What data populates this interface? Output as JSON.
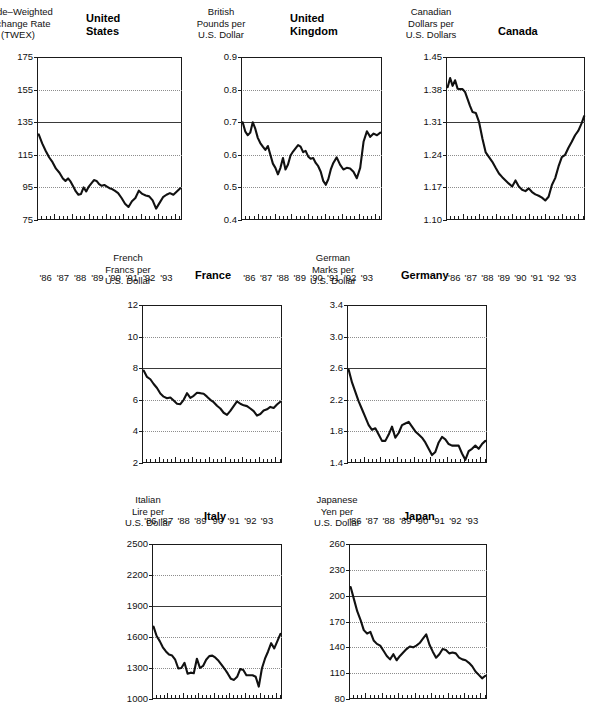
{
  "figure": {
    "panel_layout": "3 columns top row, 2 columns middle row, 2 columns bottom row",
    "line_color": "#111111",
    "grid_color": "#8d8d8d",
    "reference_line_color": "#3a3a3a"
  },
  "chart_data": [
    {
      "type": "line",
      "id": "united-states",
      "title": "United\nStates",
      "ylabel": "Trade–Weighted\nExchange Rate\n(TWEX)",
      "xlabel": "",
      "ylim": [
        75,
        175
      ],
      "yticks": [
        175,
        155,
        135,
        115,
        95,
        75
      ],
      "ytick_labels": [
        "175",
        "155",
        "135",
        "115",
        "95",
        "75"
      ],
      "gridlines": [
        155,
        115,
        95
      ],
      "reference_line": 135,
      "grid": true,
      "legend": "none",
      "xlim": [
        1985.5,
        1993.9
      ],
      "xticks": [
        1986,
        1987,
        1988,
        1989,
        1990,
        1991,
        1992,
        1993
      ],
      "xtick_labels": [
        "'86",
        "'87",
        "'88",
        "'89",
        "'90",
        "'91",
        "'92",
        "'93"
      ],
      "minor_xticks_per_year": 4,
      "x": [
        1985.6,
        1985.8,
        1986.0,
        1986.2,
        1986.4,
        1986.6,
        1986.8,
        1987.0,
        1987.15,
        1987.3,
        1987.45,
        1987.6,
        1987.75,
        1987.9,
        1988.05,
        1988.2,
        1988.35,
        1988.5,
        1988.65,
        1988.8,
        1988.95,
        1989.1,
        1989.25,
        1989.4,
        1989.55,
        1989.7,
        1989.85,
        1990.0,
        1990.2,
        1990.4,
        1990.6,
        1990.8,
        1991.0,
        1991.2,
        1991.4,
        1991.6,
        1991.8,
        1992.0,
        1992.2,
        1992.4,
        1992.6,
        1992.8,
        1993.0,
        1993.2,
        1993.4,
        1993.6,
        1993.8
      ],
      "values": [
        127.5,
        122.0,
        117.5,
        113.5,
        110.5,
        106.5,
        104.0,
        100.5,
        99.0,
        100.5,
        98.5,
        95.5,
        92.5,
        90.5,
        91.0,
        95.0,
        92.5,
        95.5,
        97.5,
        99.5,
        99.0,
        97.0,
        96.0,
        96.5,
        95.5,
        94.5,
        94.0,
        93.0,
        91.5,
        88.5,
        85.0,
        83.0,
        86.5,
        88.5,
        93.0,
        91.0,
        90.0,
        89.5,
        87.0,
        82.0,
        85.5,
        89.0,
        90.5,
        91.5,
        90.5,
        92.5,
        94.5
      ]
    },
    {
      "type": "line",
      "id": "united-kingdom",
      "title": "United\nKingdom",
      "ylabel": "British\nPounds per\nU.S. Dollar",
      "xlabel": "",
      "ylim": [
        0.4,
        0.9
      ],
      "yticks": [
        0.9,
        0.8,
        0.7,
        0.6,
        0.5,
        0.4
      ],
      "ytick_labels": [
        "0.9",
        "0.8",
        "0.7",
        "0.6",
        "0.5",
        "0.4"
      ],
      "gridlines": [
        0.8,
        0.6,
        0.5
      ],
      "reference_line": 0.7,
      "grid": true,
      "legend": "none",
      "xlim": [
        1985.5,
        1993.9
      ],
      "xticks": [
        1986,
        1987,
        1988,
        1989,
        1990,
        1991,
        1992,
        1993
      ],
      "xtick_labels": [
        "'86",
        "'87",
        "'88",
        "'89",
        "'90",
        "'91",
        "'92",
        "'93"
      ],
      "minor_xticks_per_year": 4,
      "x": [
        1985.6,
        1985.75,
        1985.9,
        1986.05,
        1986.2,
        1986.35,
        1986.5,
        1986.65,
        1986.8,
        1986.95,
        1987.1,
        1987.25,
        1987.4,
        1987.55,
        1987.7,
        1987.85,
        1988.0,
        1988.15,
        1988.3,
        1988.45,
        1988.6,
        1988.75,
        1988.9,
        1989.05,
        1989.2,
        1989.35,
        1989.5,
        1989.65,
        1989.8,
        1989.95,
        1990.1,
        1990.25,
        1990.4,
        1990.55,
        1990.7,
        1990.85,
        1991.0,
        1991.2,
        1991.4,
        1991.6,
        1991.8,
        1992.0,
        1992.2,
        1992.4,
        1992.6,
        1992.8,
        1993.0,
        1993.2,
        1993.4,
        1993.6,
        1993.8
      ],
      "values": [
        0.7,
        0.672,
        0.66,
        0.668,
        0.7,
        0.68,
        0.652,
        0.636,
        0.625,
        0.615,
        0.627,
        0.6,
        0.573,
        0.56,
        0.54,
        0.56,
        0.59,
        0.555,
        0.57,
        0.598,
        0.61,
        0.62,
        0.63,
        0.625,
        0.608,
        0.612,
        0.595,
        0.588,
        0.59,
        0.575,
        0.565,
        0.548,
        0.52,
        0.508,
        0.525,
        0.555,
        0.575,
        0.592,
        0.57,
        0.555,
        0.56,
        0.558,
        0.548,
        0.528,
        0.56,
        0.64,
        0.672,
        0.655,
        0.665,
        0.66,
        0.668
      ]
    },
    {
      "type": "line",
      "id": "canada",
      "title": "Canada",
      "ylabel": "Canadian\nDollars per\nU.S. Dollars",
      "xlabel": "",
      "ylim": [
        1.1,
        1.45
      ],
      "yticks": [
        1.45,
        1.38,
        1.31,
        1.24,
        1.17,
        1.1
      ],
      "ytick_labels": [
        "1.45",
        "1.38",
        "1.31",
        "1.24",
        "1.17",
        "1.10"
      ],
      "gridlines": [
        1.38,
        1.24,
        1.17
      ],
      "reference_line": 1.31,
      "grid": true,
      "legend": "none",
      "xlim": [
        1985.5,
        1993.9
      ],
      "xticks": [
        1986,
        1987,
        1988,
        1989,
        1990,
        1991,
        1992,
        1993
      ],
      "xtick_labels": [
        "'86",
        "'87",
        "'88",
        "'89",
        "'90",
        "'91",
        "'92",
        "'93"
      ],
      "minor_xticks_per_year": 4,
      "x": [
        1985.6,
        1985.75,
        1985.9,
        1986.05,
        1986.2,
        1986.35,
        1986.5,
        1986.65,
        1986.8,
        1986.95,
        1987.1,
        1987.3,
        1987.5,
        1987.7,
        1987.9,
        1988.1,
        1988.3,
        1988.5,
        1988.7,
        1988.9,
        1989.1,
        1989.3,
        1989.5,
        1989.7,
        1989.9,
        1990.1,
        1990.3,
        1990.5,
        1990.7,
        1990.9,
        1991.1,
        1991.3,
        1991.5,
        1991.7,
        1991.9,
        1992.1,
        1992.3,
        1992.5,
        1992.7,
        1992.9,
        1993.1,
        1993.3,
        1993.5,
        1993.7,
        1993.85
      ],
      "values": [
        1.385,
        1.405,
        1.388,
        1.4,
        1.382,
        1.381,
        1.381,
        1.375,
        1.36,
        1.345,
        1.332,
        1.33,
        1.31,
        1.275,
        1.245,
        1.235,
        1.225,
        1.212,
        1.2,
        1.192,
        1.185,
        1.178,
        1.172,
        1.185,
        1.172,
        1.165,
        1.162,
        1.168,
        1.16,
        1.155,
        1.152,
        1.148,
        1.142,
        1.15,
        1.175,
        1.19,
        1.215,
        1.235,
        1.24,
        1.255,
        1.268,
        1.282,
        1.292,
        1.308,
        1.323
      ]
    },
    {
      "type": "line",
      "id": "france",
      "title": "France",
      "ylabel": "French\nFrancs per\nU.S. Dollar",
      "xlabel": "",
      "ylim": [
        2,
        12
      ],
      "yticks": [
        12,
        10,
        8,
        6,
        4,
        2
      ],
      "ytick_labels": [
        "12",
        "10",
        "8",
        "6",
        "4",
        "2"
      ],
      "gridlines": [
        10,
        6,
        4
      ],
      "reference_line": 8,
      "grid": true,
      "legend": "none",
      "xlim": [
        1985.5,
        1993.9
      ],
      "xticks": [
        1986,
        1987,
        1988,
        1989,
        1990,
        1991,
        1992,
        1993
      ],
      "xtick_labels": [
        "'86",
        "'87",
        "'88",
        "'89",
        "'90",
        "'91",
        "'92",
        "'93"
      ],
      "minor_xticks_per_year": 4,
      "x": [
        1985.6,
        1985.8,
        1986.0,
        1986.2,
        1986.4,
        1986.6,
        1986.8,
        1987.0,
        1987.2,
        1987.4,
        1987.6,
        1987.8,
        1988.0,
        1988.2,
        1988.4,
        1988.6,
        1988.8,
        1989.0,
        1989.2,
        1989.4,
        1989.6,
        1989.8,
        1990.0,
        1990.2,
        1990.4,
        1990.6,
        1990.8,
        1991.0,
        1991.2,
        1991.4,
        1991.6,
        1991.8,
        1992.0,
        1992.2,
        1992.4,
        1992.6,
        1992.8,
        1993.0,
        1993.2,
        1993.4,
        1993.6,
        1993.8
      ],
      "values": [
        7.85,
        7.45,
        7.3,
        7.0,
        6.75,
        6.4,
        6.2,
        6.1,
        6.15,
        5.95,
        5.75,
        5.72,
        6.0,
        6.42,
        6.12,
        6.25,
        6.45,
        6.42,
        6.38,
        6.2,
        6.0,
        5.85,
        5.62,
        5.45,
        5.18,
        5.05,
        5.3,
        5.6,
        5.9,
        5.75,
        5.65,
        5.6,
        5.45,
        5.28,
        5.0,
        5.1,
        5.32,
        5.4,
        5.55,
        5.48,
        5.7,
        5.88
      ]
    },
    {
      "type": "line",
      "id": "germany",
      "title": "Germany",
      "ylabel": "German\nMarks per\nU.S. Dollar",
      "xlabel": "",
      "ylim": [
        1.4,
        3.4
      ],
      "yticks": [
        3.4,
        3.0,
        2.6,
        2.2,
        1.8,
        1.4
      ],
      "ytick_labels": [
        "3.4",
        "3.0",
        "2.6",
        "2.2",
        "1.8",
        "1.4"
      ],
      "gridlines": [
        3.0,
        2.2,
        1.8
      ],
      "reference_line": 2.6,
      "grid": true,
      "legend": "none",
      "xlim": [
        1985.5,
        1993.9
      ],
      "xticks": [
        1986,
        1987,
        1988,
        1989,
        1990,
        1991,
        1992,
        1993
      ],
      "xtick_labels": [
        "'86",
        "'87",
        "'88",
        "'89",
        "'90",
        "'91",
        "'92",
        "'93"
      ],
      "minor_xticks_per_year": 4,
      "x": [
        1985.6,
        1985.8,
        1986.0,
        1986.2,
        1986.4,
        1986.6,
        1986.8,
        1987.0,
        1987.2,
        1987.4,
        1987.6,
        1987.8,
        1988.0,
        1988.2,
        1988.4,
        1988.6,
        1988.8,
        1989.0,
        1989.2,
        1989.4,
        1989.6,
        1989.8,
        1990.0,
        1990.2,
        1990.4,
        1990.6,
        1990.8,
        1991.0,
        1991.2,
        1991.4,
        1991.6,
        1991.8,
        1992.0,
        1992.2,
        1992.4,
        1992.6,
        1992.8,
        1993.0,
        1993.2,
        1993.4,
        1993.6,
        1993.8
      ],
      "values": [
        2.58,
        2.42,
        2.3,
        2.18,
        2.08,
        1.98,
        1.88,
        1.82,
        1.84,
        1.76,
        1.68,
        1.68,
        1.76,
        1.86,
        1.72,
        1.78,
        1.88,
        1.9,
        1.92,
        1.86,
        1.8,
        1.76,
        1.72,
        1.66,
        1.58,
        1.5,
        1.54,
        1.66,
        1.73,
        1.7,
        1.64,
        1.62,
        1.62,
        1.62,
        1.52,
        1.44,
        1.55,
        1.58,
        1.62,
        1.58,
        1.64,
        1.68
      ]
    },
    {
      "type": "line",
      "id": "italy",
      "title": "Italy",
      "ylabel": "Italian\nLire per\nU.S. Dollar",
      "xlabel": "",
      "ylim": [
        1000,
        2500
      ],
      "yticks": [
        2500,
        2200,
        1900,
        1600,
        1300,
        1000
      ],
      "ytick_labels": [
        "2500",
        "2200",
        "1900",
        "1600",
        "1300",
        "1000"
      ],
      "gridlines": [
        2200,
        1600,
        1300
      ],
      "reference_line": 1900,
      "grid": true,
      "legend": "none",
      "xlim": [
        1985.5,
        1993.9
      ],
      "xticks": [
        1986,
        1987,
        1988,
        1989,
        1990,
        1991,
        1992,
        1993
      ],
      "xtick_labels": [
        "'86",
        "'87",
        "'88",
        "'89",
        "'90",
        "'91",
        "'92",
        "'93"
      ],
      "minor_xticks_per_year": 4,
      "x": [
        1985.6,
        1985.8,
        1986.0,
        1986.2,
        1986.4,
        1986.6,
        1986.8,
        1987.0,
        1987.2,
        1987.4,
        1987.6,
        1987.8,
        1988.0,
        1988.2,
        1988.4,
        1988.6,
        1988.8,
        1989.0,
        1989.2,
        1989.4,
        1989.6,
        1989.8,
        1990.0,
        1990.2,
        1990.4,
        1990.6,
        1990.8,
        1991.0,
        1991.2,
        1991.4,
        1991.6,
        1991.8,
        1992.0,
        1992.2,
        1992.4,
        1992.6,
        1992.8,
        1993.0,
        1993.2,
        1993.4,
        1993.6,
        1993.8
      ],
      "values": [
        1700,
        1610,
        1560,
        1500,
        1460,
        1430,
        1420,
        1380,
        1295,
        1300,
        1350,
        1245,
        1255,
        1250,
        1390,
        1300,
        1320,
        1380,
        1415,
        1420,
        1400,
        1370,
        1330,
        1290,
        1245,
        1195,
        1185,
        1215,
        1290,
        1280,
        1230,
        1230,
        1230,
        1215,
        1120,
        1295,
        1390,
        1460,
        1540,
        1490,
        1560,
        1630
      ]
    },
    {
      "type": "line",
      "id": "japan",
      "title": "Japan",
      "ylabel": "Japanese\nYen per\nU.S. Dollar",
      "xlabel": "",
      "ylim": [
        80,
        260
      ],
      "yticks": [
        260,
        230,
        200,
        170,
        140,
        110,
        80
      ],
      "ytick_labels": [
        "260",
        "230",
        "200",
        "170",
        "140",
        "110",
        "80"
      ],
      "gridlines": [
        230,
        170,
        140,
        110
      ],
      "reference_line": 200,
      "grid": true,
      "legend": "none",
      "xlim": [
        1985.5,
        1993.9
      ],
      "xticks": [
        1986,
        1987,
        1988,
        1989,
        1990,
        1991,
        1992,
        1993
      ],
      "xtick_labels": [
        "'86",
        "'87",
        "'88",
        "'89",
        "'90",
        "'91",
        "'92",
        "'93"
      ],
      "minor_xticks_per_year": 4,
      "x": [
        1985.6,
        1985.8,
        1986.0,
        1986.2,
        1986.4,
        1986.6,
        1986.8,
        1987.0,
        1987.2,
        1987.4,
        1987.6,
        1987.8,
        1988.0,
        1988.2,
        1988.4,
        1988.6,
        1988.8,
        1989.0,
        1989.2,
        1989.4,
        1989.6,
        1989.8,
        1990.0,
        1990.2,
        1990.4,
        1990.6,
        1990.8,
        1991.0,
        1991.2,
        1991.4,
        1991.6,
        1991.8,
        1992.0,
        1992.2,
        1992.4,
        1992.6,
        1992.8,
        1993.0,
        1993.2,
        1993.4,
        1993.6,
        1993.8
      ],
      "values": [
        210,
        196,
        182,
        172,
        160,
        156,
        158,
        148,
        144,
        142,
        136,
        130,
        126,
        132,
        125,
        130,
        134,
        138,
        141,
        140,
        142,
        145,
        150,
        155,
        143,
        135,
        128,
        132,
        138,
        137,
        133,
        134,
        133,
        128,
        126,
        125,
        122,
        118,
        112,
        108,
        104,
        107
      ]
    }
  ]
}
